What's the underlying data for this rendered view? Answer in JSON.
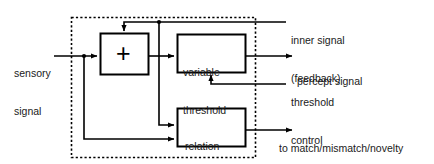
{
  "diagram": {
    "background_color": "#ffffff",
    "line_color": "#000000",
    "text_color": "#1a1a1a",
    "dashed_boundary_color": "#000000"
  },
  "inputs": {
    "sensory_signal": {
      "line1": "sensory",
      "line2": "signal"
    }
  },
  "blocks": {
    "summer": {
      "symbol": "+"
    },
    "variable_threshold": {
      "line1": "variable",
      "line2": "threshold"
    },
    "relation_detector": {
      "line1": "relation",
      "line2": "detector"
    }
  },
  "outputs": {
    "inner_signal": {
      "line1": "inner signal",
      "line2": "(feedback)"
    },
    "percept_signal": {
      "line1": "percept signal"
    },
    "threshold_control": {
      "line1": "threshold",
      "line2": "control"
    },
    "match_mismatch_novelty": {
      "line1": "to match/mismatch/novelty",
      "line2": "detector"
    }
  }
}
